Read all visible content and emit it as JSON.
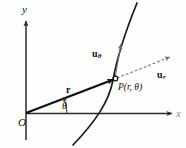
{
  "figure": {
    "background_color": "#fefefe",
    "ink_color": "#111111",
    "curve_color": "#1a1a1a",
    "axis_color": "#2b2b2b",
    "dashed_color": "#777777"
  },
  "axes": {
    "y_label": "y",
    "x_label": "x",
    "origin_label": "O"
  },
  "angle": {
    "label": "θ"
  },
  "vectors": {
    "position": {
      "label": "r",
      "subscript": ""
    },
    "u_theta": {
      "label": "u",
      "subscript": "θ"
    },
    "u_r": {
      "label": "u",
      "subscript": "r"
    }
  },
  "point": {
    "label": "P(r, θ)"
  }
}
